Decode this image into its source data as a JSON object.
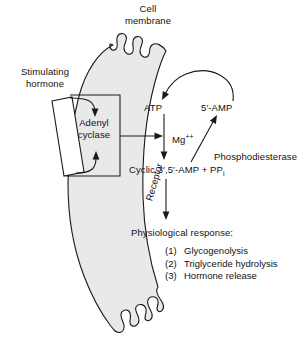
{
  "diagram": {
    "title_label": "Cell\nmembrane",
    "cell_membrane_label": "Cell membrane",
    "stimulating_hormone_label": "Stimulating hormone",
    "receptor_label": "Receptor",
    "adenyl_cyclase_label": "Adenyl cyclase",
    "atp_label": "ATP",
    "amp5_label": "5′-AMP",
    "mg_label": "Mg",
    "mg_charge": "++",
    "phosphodiesterase_label": "Phosphodiesterase",
    "cyclic_amp_label": "Cyclic 3′,5′-AMP + PP",
    "cyclic_amp_subscript": "i",
    "physiological_response_label": "Physiological response:",
    "responses": [
      {
        "num": "(1)",
        "text": "Glycogenolysis"
      },
      {
        "num": "(2)",
        "text": "Triglyceride hydrolysis"
      },
      {
        "num": "(3)",
        "text": "Hormone release"
      }
    ],
    "colors": {
      "membrane_fill": "#e9e9e9",
      "stroke": "#1a1a1a",
      "text": "#111111",
      "background": "#ffffff",
      "receptor_fill": "#ffffff"
    }
  }
}
